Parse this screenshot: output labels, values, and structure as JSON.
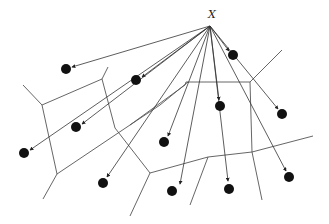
{
  "diagram": {
    "query_label": "X",
    "colors": {
      "edges": "#555555",
      "rays": "#333333",
      "sites": "#111111"
    },
    "query_point": {
      "id": "X"
    },
    "sites": [
      {
        "id": "s1"
      },
      {
        "id": "s2"
      },
      {
        "id": "s3"
      },
      {
        "id": "s4"
      },
      {
        "id": "s5"
      },
      {
        "id": "s6"
      },
      {
        "id": "s7"
      },
      {
        "id": "s8"
      },
      {
        "id": "s9"
      },
      {
        "id": "s10"
      },
      {
        "id": "s11"
      },
      {
        "id": "s12"
      }
    ],
    "site_count": 12,
    "ray_count": 12
  }
}
